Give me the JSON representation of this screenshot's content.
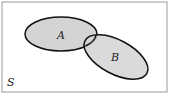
{
  "diagram": {
    "type": "venn",
    "universe_label": "S",
    "sets": [
      {
        "label": "A"
      },
      {
        "label": "B"
      }
    ],
    "colors": {
      "fill": "#d4d4d4",
      "stroke": "#111111",
      "border": "#888888",
      "background": "#ffffff"
    }
  }
}
